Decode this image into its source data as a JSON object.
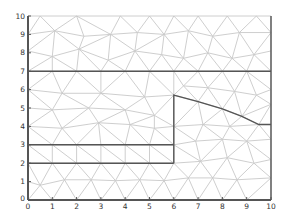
{
  "chart_data": {
    "type": "mesh",
    "title": "",
    "xlabel": "",
    "ylabel": "",
    "xlim": [
      0,
      10
    ],
    "ylim": [
      0,
      10
    ],
    "grid": false,
    "x_ticks": [
      "0",
      "1",
      "2",
      "3",
      "4",
      "5",
      "6",
      "7",
      "8",
      "9",
      "10"
    ],
    "y_ticks": [
      "0",
      "1",
      "2",
      "3",
      "4",
      "5",
      "6",
      "7",
      "8",
      "9",
      "10"
    ],
    "colors": {
      "mesh": "#c8c8c8",
      "boundary": "#555555",
      "axis": "#555555",
      "text": "#333333"
    },
    "boundaries": [
      {
        "name": "line-y7",
        "points": [
          [
            0,
            7
          ],
          [
            10,
            7
          ]
        ]
      },
      {
        "name": "line-y3",
        "points": [
          [
            0,
            3
          ],
          [
            6,
            3
          ]
        ]
      },
      {
        "name": "line-y2",
        "points": [
          [
            0,
            2
          ],
          [
            6,
            2
          ]
        ]
      },
      {
        "name": "interface",
        "points": [
          [
            6,
            2
          ],
          [
            6,
            5.7
          ],
          [
            7,
            5.35
          ],
          [
            8,
            4.95
          ],
          [
            8.8,
            4.55
          ],
          [
            9.5,
            4.1
          ],
          [
            10,
            4.1
          ]
        ]
      }
    ],
    "nodes": [
      [
        0,
        0
      ],
      [
        1,
        0
      ],
      [
        2,
        0
      ],
      [
        3,
        0
      ],
      [
        4,
        0
      ],
      [
        5,
        0
      ],
      [
        6,
        0
      ],
      [
        7,
        0
      ],
      [
        8,
        0
      ],
      [
        9,
        0
      ],
      [
        10,
        0
      ],
      [
        0,
        1
      ],
      [
        0.5,
        0.8
      ],
      [
        1.5,
        1.1
      ],
      [
        2.6,
        1.1
      ],
      [
        3.6,
        1.05
      ],
      [
        4.6,
        1.1
      ],
      [
        5.6,
        1.05
      ],
      [
        6.6,
        1.2
      ],
      [
        7.6,
        1.2
      ],
      [
        8.6,
        1.1
      ],
      [
        10,
        1.2
      ],
      [
        0,
        2
      ],
      [
        1,
        2
      ],
      [
        2,
        2
      ],
      [
        3,
        2
      ],
      [
        4,
        2
      ],
      [
        5,
        2
      ],
      [
        6,
        2
      ],
      [
        7.1,
        2.1
      ],
      [
        8.2,
        2.3
      ],
      [
        9.3,
        2.0
      ],
      [
        10,
        2.2
      ],
      [
        0,
        3
      ],
      [
        1,
        3
      ],
      [
        2,
        3
      ],
      [
        3,
        3
      ],
      [
        4,
        3
      ],
      [
        5,
        3
      ],
      [
        6,
        3
      ],
      [
        6.9,
        3.2
      ],
      [
        8.0,
        3.3
      ],
      [
        9.0,
        3.2
      ],
      [
        10,
        3.3
      ],
      [
        0,
        4
      ],
      [
        1.4,
        3.9
      ],
      [
        2.9,
        4.2
      ],
      [
        4.2,
        4.1
      ],
      [
        5.2,
        3.9
      ],
      [
        6,
        4
      ],
      [
        7.2,
        4.1
      ],
      [
        8.3,
        4.0
      ],
      [
        9.5,
        4.1
      ],
      [
        10,
        4.1
      ],
      [
        0,
        5
      ],
      [
        1,
        4.9
      ],
      [
        2.5,
        5.0
      ],
      [
        4,
        4.9
      ],
      [
        5.2,
        4.6
      ],
      [
        6,
        5.7
      ],
      [
        7,
        5.35
      ],
      [
        8,
        4.95
      ],
      [
        8.8,
        4.55
      ],
      [
        10,
        5.2
      ],
      [
        0,
        6
      ],
      [
        1.4,
        5.8
      ],
      [
        3,
        5.8
      ],
      [
        4.8,
        5.6
      ],
      [
        6.4,
        6.2
      ],
      [
        7.4,
        6.1
      ],
      [
        8.5,
        5.9
      ],
      [
        9.4,
        5.7
      ],
      [
        10,
        6.0
      ],
      [
        0,
        7
      ],
      [
        1,
        7
      ],
      [
        2,
        7
      ],
      [
        3,
        7
      ],
      [
        4,
        7
      ],
      [
        5,
        7
      ],
      [
        6,
        7
      ],
      [
        7,
        7
      ],
      [
        8,
        7
      ],
      [
        9,
        7
      ],
      [
        10,
        7
      ],
      [
        0,
        8.1
      ],
      [
        1,
        7.8
      ],
      [
        2.1,
        8.2
      ],
      [
        3.3,
        7.6
      ],
      [
        4.4,
        8.1
      ],
      [
        5.5,
        7.9
      ],
      [
        6.4,
        7.7
      ],
      [
        7.4,
        8.0
      ],
      [
        8.4,
        7.7
      ],
      [
        9.3,
        7.9
      ],
      [
        10,
        8.1
      ],
      [
        0,
        9
      ],
      [
        1.1,
        9.2
      ],
      [
        2.3,
        8.9
      ],
      [
        3.4,
        9.0
      ],
      [
        4.5,
        9.1
      ],
      [
        5.6,
        9.0
      ],
      [
        6.6,
        9.2
      ],
      [
        7.6,
        8.9
      ],
      [
        8.7,
        9.1
      ],
      [
        10,
        9.1
      ],
      [
        0,
        10
      ],
      [
        0.5,
        10
      ],
      [
        2.0,
        10
      ],
      [
        3.8,
        10
      ],
      [
        5.0,
        10
      ],
      [
        6.0,
        10
      ],
      [
        7.0,
        10
      ],
      [
        8.2,
        10
      ],
      [
        9.4,
        10
      ],
      [
        10,
        10
      ]
    ]
  }
}
